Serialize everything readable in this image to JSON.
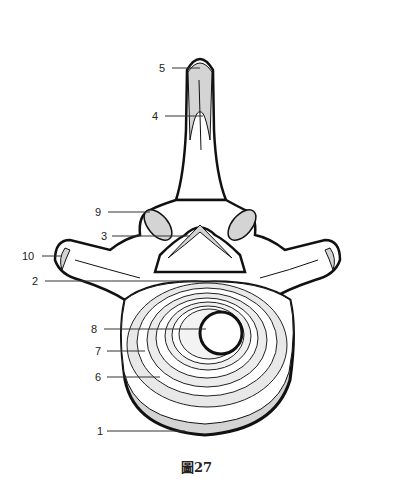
{
  "figure": {
    "caption": "圖27"
  },
  "labels": [
    {
      "id": "1",
      "text": "1"
    },
    {
      "id": "2",
      "text": "2"
    },
    {
      "id": "3",
      "text": "3"
    },
    {
      "id": "4",
      "text": "4"
    },
    {
      "id": "5",
      "text": "5"
    },
    {
      "id": "6",
      "text": "6"
    },
    {
      "id": "7",
      "text": "7"
    },
    {
      "id": "8",
      "text": "8"
    },
    {
      "id": "9",
      "text": "9"
    },
    {
      "id": "10",
      "text": "10"
    }
  ],
  "colors": {
    "outline": "#111111",
    "shade": "#d4d4d4",
    "fill": "#ffffff",
    "leader": "#333333"
  }
}
